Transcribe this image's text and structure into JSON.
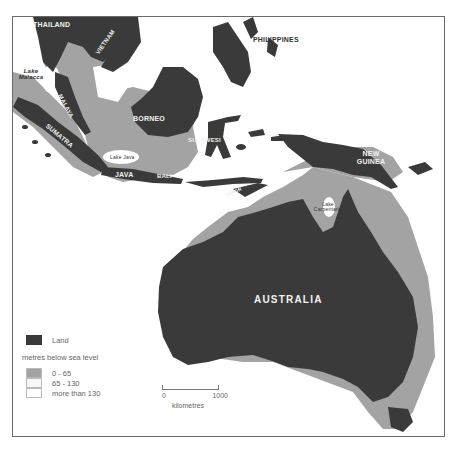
{
  "map": {
    "labels": {
      "thailand": "THAILAND",
      "vietnam": "VIETNAM",
      "philippines": "PHILIPPINES",
      "lake_malacca": "Lake Malacca",
      "malaya": "MALAYA",
      "sumatra": "SUMATRA",
      "borneo": "BORNEO",
      "sulawesi": "SULAWESI",
      "lake_java": "Lake Java",
      "java": "JAVA",
      "bali": "BALI",
      "timor": "TIMOR",
      "new_guinea": "NEW GUINEA",
      "lake_carpentaria": "Lake Carpentaria",
      "australia": "AUSTRALIA"
    },
    "colors": {
      "land": "#3a3a3a",
      "shallow_0_65": "#a3a3a3",
      "mid_65_130": "#f7f7f7",
      "deep_over_130": "#ffffff",
      "frame": "#6a6a6a"
    }
  },
  "legend": {
    "land_label": "Land",
    "depth_heading": "metres below sea level",
    "items": [
      {
        "label": "0 - 65",
        "color": "#a3a3a3"
      },
      {
        "label": "65 - 130",
        "color": "#f7f7f7"
      },
      {
        "label": "more than 130",
        "color": "#ffffff"
      }
    ]
  },
  "scale": {
    "start": "0",
    "end": "1000",
    "unit": "kilometres"
  }
}
